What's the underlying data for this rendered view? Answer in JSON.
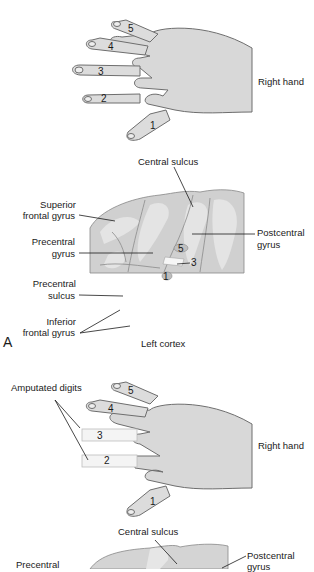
{
  "figure": {
    "panel_a": {
      "letter": "A",
      "hand": {
        "label": "Right hand",
        "digits": [
          "1",
          "2",
          "3",
          "4",
          "5"
        ]
      },
      "cortex": {
        "caption": "Left cortex",
        "labels": {
          "central_sulcus": "Central sulcus",
          "superior_frontal_gyrus_1": "Superior",
          "superior_frontal_gyrus_2": "frontal gyrus",
          "precentral_gyrus_1": "Precentral",
          "precentral_gyrus_2": "gyrus",
          "postcentral_gyrus_1": "Postcentral",
          "postcentral_gyrus_2": "gyrus",
          "precentral_sulcus_1": "Precentral",
          "precentral_sulcus_2": "sulcus",
          "inferior_frontal_gyrus_1": "Inferior",
          "inferior_frontal_gyrus_2": "frontal gyrus"
        },
        "map_numbers": [
          "5",
          "3",
          "1"
        ]
      }
    },
    "panel_b": {
      "hand": {
        "label": "Right hand",
        "amputated_label": "Amputated digits",
        "digits": [
          "1",
          "2",
          "3",
          "4",
          "5"
        ]
      },
      "cortex": {
        "labels": {
          "central_sulcus": "Central sulcus",
          "postcentral_gyrus_1": "Postcentral",
          "postcentral_gyrus_2": "gyrus",
          "precentral_1": "Precentral"
        }
      }
    },
    "colors": {
      "skin": "#d9d9d9",
      "skin_light": "#ececec",
      "outline": "#6e6e6e",
      "cortex": "#cfcfcf",
      "cortex_light": "#e2e2e2",
      "amputated": "#f4f4f4"
    }
  }
}
